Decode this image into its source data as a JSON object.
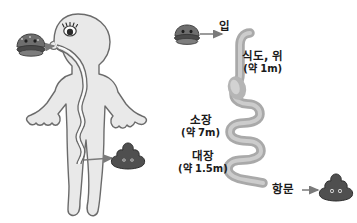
{
  "figure": {
    "background_color": "#ffffff",
    "body_fill": "#e9e9e9",
    "body_stroke": "#6b6b6b",
    "tube_fill": "#a9a9a9",
    "tube_highlight": "#cfcfcf",
    "icon_dark": "#4a4a4a",
    "text_color": "#1a1a1a",
    "arrow_color": "#7a7a7a"
  },
  "left_panel": {
    "name": "human-body-digestive-diagram",
    "food_icon": "hamburger-icon",
    "waste_icon": "poop-icon",
    "intake_arrow": "arrow-into-mouth",
    "output_arrow": "arrow-to-waste"
  },
  "right_panel": {
    "name": "unrolled-digestive-tract-diagram",
    "food_icon": "hamburger-icon",
    "waste_icon": "poop-icon",
    "labels": [
      {
        "id": "mouth",
        "main": "입",
        "sub": "",
        "x": 227,
        "y": 27
      },
      {
        "id": "esophagus-stomach",
        "main": "식도, 위",
        "sub": "(약 1m)",
        "x": 272,
        "y": 58
      },
      {
        "id": "small-intestine",
        "main": "소장",
        "sub": "(약 7m)",
        "x": 208,
        "y": 122
      },
      {
        "id": "large-intestine",
        "main": "대장",
        "sub": "(약 1.5m)",
        "x": 208,
        "y": 158
      },
      {
        "id": "anus",
        "main": "항문",
        "sub": "",
        "x": 281,
        "y": 186
      }
    ]
  }
}
